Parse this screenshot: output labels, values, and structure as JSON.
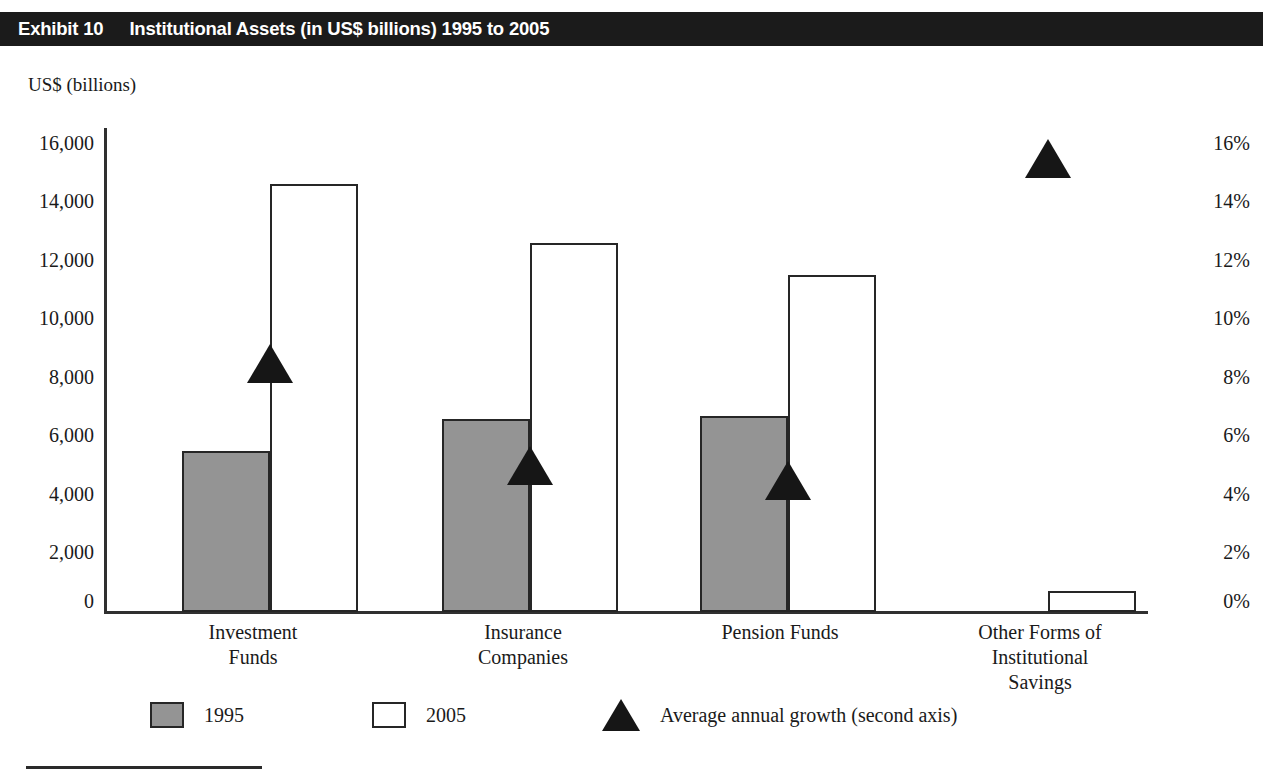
{
  "header": {
    "exhibit_label": "Exhibit 10",
    "title": "Institutional Assets (in US$ billions) 1995 to 2005"
  },
  "axis_unit_label": "US$ (billions)",
  "legend": {
    "items": [
      {
        "key": "1995",
        "label": "1995",
        "marker": "gray-square",
        "color": "#949494"
      },
      {
        "key": "2005",
        "label": "2005",
        "marker": "white-square",
        "color": "#ffffff"
      },
      {
        "key": "growth",
        "label": "Average annual growth (second axis)",
        "marker": "black-triangle",
        "color": "#161616"
      }
    ]
  },
  "chart_data": {
    "type": "bar",
    "title": "Institutional Assets (in US$ billions) 1995 to 2005",
    "xlabel": "",
    "ylabel": "US$ (billions)",
    "y2label": "",
    "ylim": [
      0,
      16000
    ],
    "y2lim": [
      0,
      16
    ],
    "yticks": [
      0,
      2000,
      4000,
      6000,
      8000,
      10000,
      12000,
      14000,
      16000
    ],
    "ytick_labels": [
      "0",
      "2,000",
      "4,000",
      "6,000",
      "8,000",
      "10,000",
      "12,000",
      "14,000",
      "16,000"
    ],
    "y2ticks": [
      0,
      2,
      4,
      6,
      8,
      10,
      12,
      14,
      16
    ],
    "y2tick_labels": [
      "0%",
      "2%",
      "4%",
      "6%",
      "8%",
      "10%",
      "12%",
      "14%",
      "16%"
    ],
    "grid": false,
    "legend_position": "bottom",
    "categories": [
      "Investment\nFunds",
      "Insurance\nCompanies",
      "Pension Funds",
      "Other Forms of\nInstitutional\nSavings"
    ],
    "series": [
      {
        "name": "1995",
        "axis": "left",
        "values": [
          5500,
          6600,
          6700,
          0
        ]
      },
      {
        "name": "2005",
        "axis": "left",
        "values": [
          14600,
          12600,
          11500,
          700
        ]
      },
      {
        "name": "Average annual growth (second axis)",
        "axis": "right",
        "type": "marker",
        "values": [
          8.5,
          5.0,
          4.5,
          15.5
        ]
      }
    ]
  }
}
